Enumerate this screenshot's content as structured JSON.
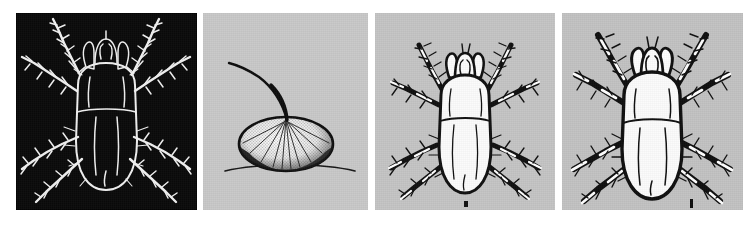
{
  "figure": {
    "type": "scientific-plate",
    "page_background": "#ffffff",
    "panel_count": 4
  },
  "panels": [
    {
      "id": "panel-1",
      "name": "mite-negative-dorsal",
      "content": "dorsal view of mite rendered as photographic negative, white outline on black field",
      "background": "#0a0a0a",
      "line_color": "#f2f2f2",
      "x": 16,
      "y": 13,
      "width": 181,
      "height": 197,
      "scale_bar": false
    },
    {
      "id": "panel-2",
      "name": "stalked-egg",
      "content": "single stippled egg with curved stalk resting on a substrate line",
      "background": "#c8c8c8",
      "line_color": "#111111",
      "x": 203,
      "y": 13,
      "width": 165,
      "height": 197,
      "scale_bar": false
    },
    {
      "id": "panel-3",
      "name": "mite-positive-dorsal-small",
      "content": "dorsal view of mite, black outline with white body on grey field",
      "background": "#c4c4c4",
      "line_color": "#111111",
      "x": 375,
      "y": 13,
      "width": 180,
      "height": 197,
      "scale_bar": true
    },
    {
      "id": "panel-4",
      "name": "mite-positive-dorsal-large",
      "content": "dorsal view of mite at larger magnification, black outline with white body on grey field",
      "background": "#c2c2c2",
      "line_color": "#111111",
      "x": 562,
      "y": 13,
      "width": 181,
      "height": 197,
      "scale_bar": true
    }
  ],
  "anatomy_labels": {
    "gnathosoma": "gnathosoma",
    "chelicerae": "chelicerae",
    "idiosoma": "idiosoma",
    "sejugal_furrow": "sejugal furrow",
    "legs": "legs I-IV",
    "setae": "setae",
    "egg_stalk": "egg stalk",
    "substrate_line": "substrate line"
  },
  "colors": {
    "paper": "#ffffff",
    "negative_field": "#0a0a0a",
    "negative_line": "#f2f2f2",
    "grey_field": "#c4c4c4",
    "ink": "#111111",
    "body_fill": "#fbfbfb",
    "scale_bar": "#101010"
  },
  "scale_bars": {
    "panel_3": {
      "x": 468,
      "y": 201,
      "width": 4,
      "height": 6
    },
    "panel_4": {
      "x": 690,
      "y": 200,
      "width": 3,
      "height": 9
    }
  }
}
